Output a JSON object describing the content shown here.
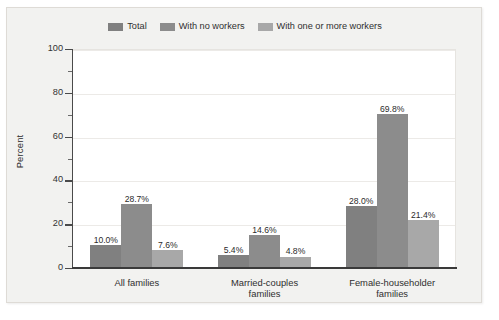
{
  "chart_data": {
    "type": "bar",
    "title": "",
    "xlabel": "",
    "ylabel": "Percent",
    "ylim": [
      0,
      100
    ],
    "ytick_labels": [
      "0",
      "20",
      "40",
      "60",
      "80",
      "100"
    ],
    "ytick_values": [
      0,
      20,
      40,
      60,
      80,
      100
    ],
    "yminor_values": [
      10,
      30,
      50,
      70,
      90
    ],
    "grid": "horizontal-major",
    "legend_position": "top-center",
    "categories": [
      "All families",
      "Married-couples families",
      "Female-householder families"
    ],
    "category_lines": [
      [
        "All families"
      ],
      [
        "Married-couples",
        "families"
      ],
      [
        "Female-householder",
        "families"
      ]
    ],
    "series": [
      {
        "name": "Total",
        "color": "#808080",
        "values": [
          10.0,
          5.4,
          28.0
        ],
        "labels": [
          "10.0%",
          "5.4%",
          "28.0%"
        ]
      },
      {
        "name": "With no workers",
        "color": "#8c8c8c",
        "values": [
          28.7,
          14.6,
          69.8
        ],
        "labels": [
          "28.7%",
          "14.6%",
          "69.8%"
        ]
      },
      {
        "name": "With one or more workers",
        "color": "#a8a8a8",
        "values": [
          7.6,
          4.8,
          21.4
        ],
        "labels": [
          "7.6%",
          "4.8%",
          "21.4%"
        ]
      }
    ]
  },
  "colors": {
    "figure_background": "#f2f2f0",
    "plot_background": "#ffffff",
    "axis": "#3a3a3a",
    "gridline": "#eceae7",
    "text": "#2f2f2f"
  }
}
